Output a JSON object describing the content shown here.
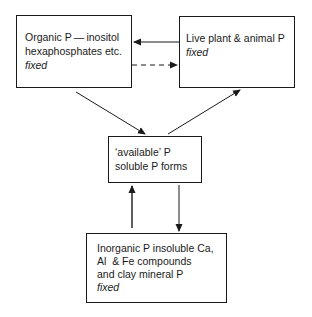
{
  "diagram": {
    "type": "flow",
    "nodes": {
      "organic": {
        "lines": [
          "Organic P — inositol",
          "hexaphosphates etc."
        ],
        "status": "fixed"
      },
      "live": {
        "lines": [
          "Live plant & animal P"
        ],
        "status": "fixed"
      },
      "available": {
        "lines": [
          "‘available’ P",
          "soluble P forms"
        ]
      },
      "inorganic": {
        "lines": [
          "Inorganic P insoluble Ca,",
          "Al  & Fe compounds",
          "and clay mineral P"
        ],
        "status": "fixed"
      }
    },
    "edges": [
      {
        "from": "live",
        "to": "organic",
        "style": "solid"
      },
      {
        "from": "organic",
        "to": "live",
        "style": "dashed"
      },
      {
        "from": "organic",
        "to": "available",
        "style": "solid"
      },
      {
        "from": "available",
        "to": "live",
        "style": "solid"
      },
      {
        "from": "inorganic",
        "to": "available",
        "style": "solid"
      },
      {
        "from": "available",
        "to": "inorganic",
        "style": "solid"
      }
    ],
    "colors": {
      "stroke": "#1a1a1a",
      "background": "#ffffff"
    }
  }
}
